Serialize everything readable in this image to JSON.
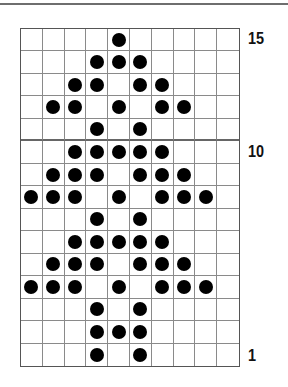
{
  "chart": {
    "columns": 10,
    "rows": 15,
    "colors": {
      "dot": "#000000",
      "grid": "#8a8a8a",
      "background": "#ffffff"
    },
    "row_labels": [
      {
        "row": 15,
        "label": "15"
      },
      {
        "row": 10,
        "label": "10"
      },
      {
        "row": 1,
        "label": "1"
      }
    ],
    "dots_by_row": {
      "15": [
        5
      ],
      "14": [
        4,
        5,
        6
      ],
      "13": [
        3,
        4,
        6,
        7
      ],
      "12": [
        2,
        3,
        5,
        7,
        8
      ],
      "11": [
        4,
        6
      ],
      "10": [
        3,
        4,
        5,
        6,
        7
      ],
      "9": [
        2,
        3,
        4,
        6,
        7,
        8
      ],
      "8": [
        1,
        2,
        3,
        5,
        7,
        8,
        9
      ],
      "7": [
        4,
        6
      ],
      "6": [
        3,
        4,
        5,
        6,
        7
      ],
      "5": [
        2,
        3,
        4,
        6,
        7,
        8
      ],
      "4": [
        1,
        2,
        3,
        5,
        7,
        8,
        9
      ],
      "3": [
        4,
        6
      ],
      "2": [
        4,
        5,
        6
      ],
      "1": [
        4,
        6
      ]
    }
  }
}
